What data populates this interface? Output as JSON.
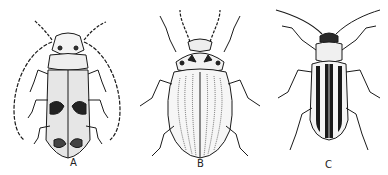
{
  "figure": {
    "background": "#ffffff",
    "ink": "#1a1a1a",
    "specimens": [
      {
        "label": "A",
        "description": "longhorn beetle with long curved segmented antennae and mottled elytra"
      },
      {
        "label": "B",
        "description": "oval leaf beetle with finely striated elytra and spotted pronotum"
      },
      {
        "label": "C",
        "description": "elongate striped leaf beetle with dark longitudinal stripes on elytra"
      }
    ]
  }
}
